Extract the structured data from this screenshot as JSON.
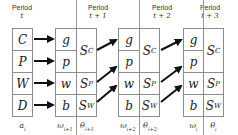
{
  "periods": [
    {
      "title": "Period",
      "sub": "t"
    },
    {
      "title": "Period",
      "sub": "t + 1"
    },
    {
      "title": "Period",
      "sub": "t + 2"
    },
    {
      "title": "Period",
      "sub": "t + 3"
    }
  ],
  "column_a": {
    "cells": [
      "C",
      "P",
      "W",
      "D"
    ],
    "label": "a",
    "label_sub": "i"
  },
  "blocks": [
    {
      "omega_cells": [
        "g",
        "p",
        "w",
        "b"
      ],
      "theta_cells": [
        {
          "main": "S",
          "sub": "C"
        },
        {
          "main": "S",
          "sub": "P"
        },
        {
          "main": "S",
          "sub": "W"
        }
      ],
      "omega_label": "ω",
      "omega_label_sub": "i+1",
      "theta_label": "θ",
      "theta_label_sub": "i+1"
    },
    {
      "omega_cells": [
        "g",
        "p",
        "w",
        "b"
      ],
      "theta_cells": [
        {
          "main": "S",
          "sub": "C"
        },
        {
          "main": "S",
          "sub": "P"
        },
        {
          "main": "S",
          "sub": "W"
        }
      ],
      "omega_label": "ω",
      "omega_label_sub": "i+2",
      "theta_label": "θ",
      "theta_label_sub": "i+2"
    },
    {
      "omega_cells": [
        "g",
        "p",
        "w",
        "b"
      ],
      "theta_cells": [
        {
          "main": "S",
          "sub": "C"
        },
        {
          "main": "S",
          "sub": "P"
        },
        {
          "main": "S",
          "sub": "W"
        }
      ],
      "omega_label": "ω",
      "omega_label_sub": "i",
      "theta_label": "θ",
      "theta_label_sub": "i"
    }
  ],
  "colors": {
    "line": "#8c8c8c",
    "arrow": "#111111",
    "divider": "#9a9a9a"
  }
}
